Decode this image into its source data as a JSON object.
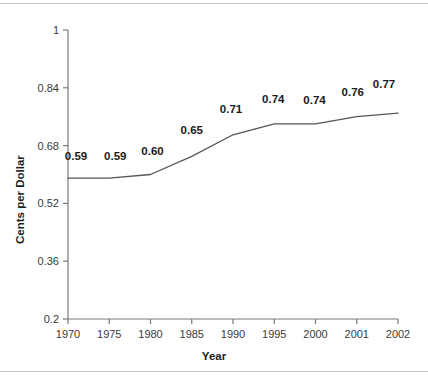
{
  "chart_data": {
    "type": "line",
    "title": "",
    "xlabel": "Year",
    "ylabel": "Cents per Dollar",
    "categories": [
      "1970",
      "1975",
      "1980",
      "1985",
      "1990",
      "1995",
      "2000",
      "2001",
      "2002"
    ],
    "values": [
      0.59,
      0.59,
      0.6,
      0.65,
      0.71,
      0.74,
      0.74,
      0.76,
      0.77
    ],
    "point_labels": [
      "0.59",
      "0.59",
      "0.60",
      "0.65",
      "0.71",
      "0.74",
      "0.74",
      "0.76",
      "0.77"
    ],
    "ylim": [
      0.2,
      1
    ],
    "yticks": [
      0.2,
      0.36,
      0.52,
      0.68,
      0.84,
      1
    ],
    "ytick_labels": [
      "0.2",
      "0.36",
      "0.52",
      "0.68",
      "0.84",
      "1"
    ],
    "grid": false,
    "legend": null,
    "series": [
      {
        "name": "Cents per Dollar",
        "values": [
          0.59,
          0.59,
          0.6,
          0.65,
          0.71,
          0.74,
          0.74,
          0.76,
          0.77
        ],
        "color": "#555555"
      }
    ]
  },
  "colors": {
    "line": "#555555",
    "axis": "#7a7a7a",
    "text": "#1a1a1a",
    "tick_text": "#3a3a3a",
    "frame_rule": "#c9c9c9",
    "background": "#ffffff"
  }
}
